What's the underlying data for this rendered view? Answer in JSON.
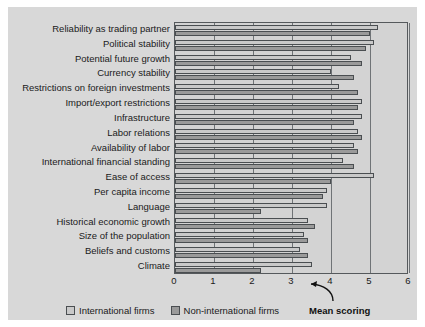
{
  "chart_data": {
    "type": "bar",
    "orientation": "horizontal",
    "title": "",
    "xlabel": "Mean scoring",
    "ylabel": "",
    "xlim": [
      0,
      6
    ],
    "xticks": [
      "0",
      "1",
      "2",
      "3",
      "4",
      "5",
      "6"
    ],
    "grid": true,
    "legend_position": "bottom",
    "categories": [
      "Reliability as trading partner",
      "Political stability",
      "Potential future growth",
      "Currency stability",
      "Restrictions on foreign investments",
      "Import/export restrictions",
      "Infrastructure",
      "Labor relations",
      "Availability of labor",
      "International financial standing",
      "Ease of access",
      "Per capita income",
      "Language",
      "Historical economic growth",
      "Size of the population",
      "Beliefs and customs",
      "Climate"
    ],
    "series": [
      {
        "name": "International firms",
        "color": "#c9c9c9",
        "values": [
          5.2,
          5.1,
          4.5,
          4.0,
          4.2,
          4.8,
          4.8,
          4.7,
          4.6,
          4.3,
          5.1,
          3.9,
          3.9,
          3.4,
          3.3,
          3.2,
          3.5
        ]
      },
      {
        "name": "Non-international firms",
        "color": "#9a9a9a",
        "values": [
          5.0,
          4.9,
          4.8,
          4.6,
          4.7,
          4.7,
          4.6,
          4.8,
          4.7,
          4.6,
          4.0,
          3.8,
          2.2,
          3.6,
          3.4,
          3.4,
          2.2
        ]
      }
    ]
  },
  "legend": {
    "items": [
      {
        "label": "International firms",
        "swatch": "intl"
      },
      {
        "label": "Non-international firms",
        "swatch": "nonintl"
      }
    ],
    "axis_title": "Mean scoring"
  }
}
